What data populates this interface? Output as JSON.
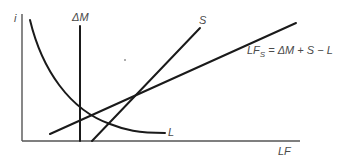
{
  "diagram": {
    "title": "",
    "axes": {
      "y_label": "i",
      "x_label": "LF"
    },
    "curves": [
      {
        "id": "delta-m",
        "label": "ΔM",
        "kind": "vertical line"
      },
      {
        "id": "l-curve",
        "label": "L",
        "kind": "downward-sloping convex curve"
      },
      {
        "id": "s-line",
        "label": "S",
        "kind": "upward-sloping steep line"
      },
      {
        "id": "lfs-line",
        "label_main": "LF",
        "label_sub": "S",
        "label_eq": " = ΔM + S − L",
        "kind": "upward-sloping flatter line"
      }
    ],
    "colors": {
      "line": "#1a1a1a",
      "axis": "#555555",
      "text": "#4a4a4a"
    }
  }
}
